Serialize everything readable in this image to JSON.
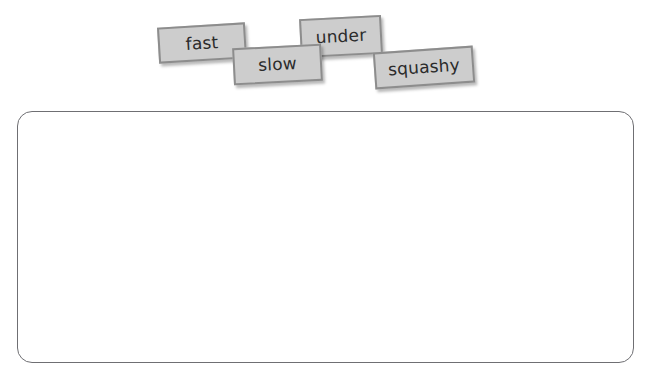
{
  "worksheet": {
    "background_color": "#ffffff"
  },
  "word_bank": {
    "tiles": [
      {
        "label": "fast",
        "name": "word-tile-fast"
      },
      {
        "label": "slow",
        "name": "word-tile-slow"
      },
      {
        "label": "under",
        "name": "word-tile-under"
      },
      {
        "label": "squashy",
        "name": "word-tile-squashy"
      }
    ],
    "tile_fill_color": "#cdcdcd",
    "tile_border_color": "#8d8d8d",
    "tile_text_color": "#2b2b2b"
  },
  "answer_box": {
    "content": "",
    "border_color": "#6f6f73",
    "fill_color": "#ffffff"
  }
}
